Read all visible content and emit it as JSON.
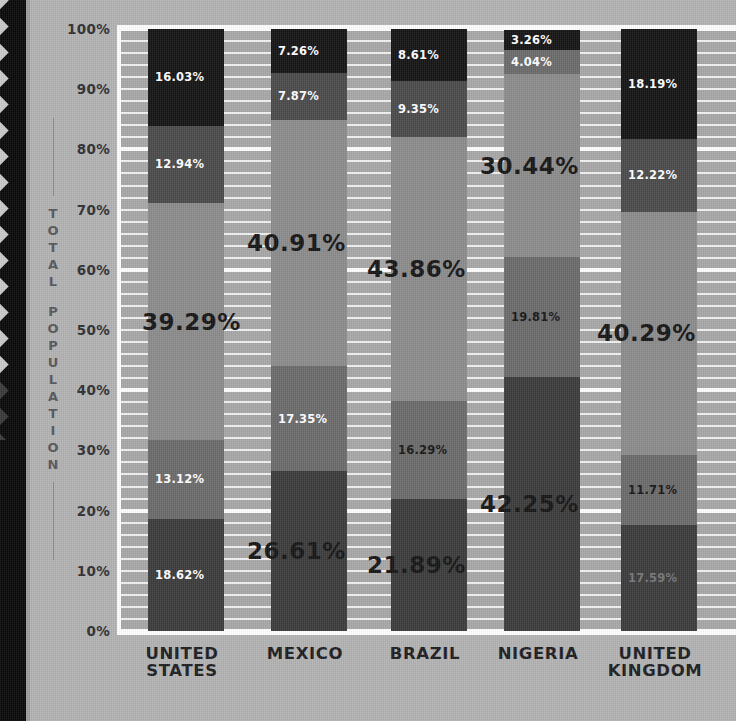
{
  "axis": {
    "title": "TOTAL POPULATION",
    "yticks": [
      "100%",
      "90%",
      "80%",
      "70%",
      "60%",
      "50%",
      "40%",
      "30%",
      "20%",
      "10%",
      "0%"
    ]
  },
  "colors": {
    "background": "#b3b3b3",
    "plot_background": "#a8a8a8",
    "gridline": "#f2f2f2",
    "gridline_major": "#ffffff",
    "band": "#080808",
    "segment_1": "#3b3b3b",
    "segment_2": "#6b6b6b",
    "segment_3": "#8c8c8c",
    "segment_4": "#4a4a4a",
    "segment_5": "#141414",
    "label_light": "#ffffff",
    "label_dark": "#151515"
  },
  "chart_data": {
    "type": "bar",
    "title": "",
    "xlabel": "",
    "ylabel": "TOTAL POPULATION",
    "ylim": [
      0,
      100
    ],
    "stacked": true,
    "grid": true,
    "legend": "none",
    "categories": [
      "UNITED STATES",
      "MEXICO",
      "BRAZIL",
      "NIGERIA",
      "UNITED KINGDOM"
    ],
    "category_lines": [
      [
        "UNITED",
        "STATES"
      ],
      [
        "MEXICO",
        ""
      ],
      [
        "BRAZIL",
        ""
      ],
      [
        "NIGERIA",
        ""
      ],
      [
        "UNITED",
        "KINGDOM"
      ]
    ],
    "series": [
      {
        "name": "Segment 1",
        "values": [
          18.62,
          26.61,
          21.89,
          42.25,
          17.59
        ]
      },
      {
        "name": "Segment 2",
        "values": [
          13.12,
          17.35,
          16.29,
          19.81,
          11.71
        ]
      },
      {
        "name": "Segment 3",
        "values": [
          39.29,
          40.91,
          43.86,
          30.44,
          40.29
        ]
      },
      {
        "name": "Segment 4",
        "values": [
          12.94,
          7.87,
          9.35,
          4.04,
          12.22
        ]
      },
      {
        "name": "Segment 5",
        "values": [
          16.03,
          7.26,
          8.61,
          3.26,
          18.19
        ]
      }
    ],
    "bars": [
      {
        "category": "UNITED STATES",
        "segments": [
          {
            "value": 18.62,
            "label": "18.62%",
            "color": "#3b3b3b",
            "text_color": "#ffffff",
            "emphasis": "small"
          },
          {
            "value": 13.12,
            "label": "13.12%",
            "color": "#6b6b6b",
            "text_color": "#ffffff",
            "emphasis": "small"
          },
          {
            "value": 39.29,
            "label": "39.29%",
            "color": "#8c8c8c",
            "text_color": "#151515",
            "emphasis": "big"
          },
          {
            "value": 12.94,
            "label": "12.94%",
            "color": "#4a4a4a",
            "text_color": "#ffffff",
            "emphasis": "small"
          },
          {
            "value": 16.03,
            "label": "16.03%",
            "color": "#141414",
            "text_color": "#ffffff",
            "emphasis": "small"
          }
        ]
      },
      {
        "category": "MEXICO",
        "segments": [
          {
            "value": 26.61,
            "label": "26.61%",
            "color": "#3b3b3b",
            "text_color": "#151515",
            "emphasis": "big"
          },
          {
            "value": 17.35,
            "label": "17.35%",
            "color": "#6b6b6b",
            "text_color": "#ffffff",
            "emphasis": "small"
          },
          {
            "value": 40.91,
            "label": "40.91%",
            "color": "#8c8c8c",
            "text_color": "#151515",
            "emphasis": "big"
          },
          {
            "value": 7.87,
            "label": "7.87%",
            "color": "#4a4a4a",
            "text_color": "#ffffff",
            "emphasis": "small"
          },
          {
            "value": 7.26,
            "label": "7.26%",
            "color": "#141414",
            "text_color": "#ffffff",
            "emphasis": "small"
          }
        ]
      },
      {
        "category": "BRAZIL",
        "segments": [
          {
            "value": 21.89,
            "label": "21.89%",
            "color": "#3b3b3b",
            "text_color": "#151515",
            "emphasis": "big"
          },
          {
            "value": 16.29,
            "label": "16.29%",
            "color": "#6b6b6b",
            "text_color": "#151515",
            "emphasis": "small"
          },
          {
            "value": 43.86,
            "label": "43.86%",
            "color": "#8c8c8c",
            "text_color": "#151515",
            "emphasis": "big"
          },
          {
            "value": 9.35,
            "label": "9.35%",
            "color": "#4a4a4a",
            "text_color": "#ffffff",
            "emphasis": "small"
          },
          {
            "value": 8.61,
            "label": "8.61%",
            "color": "#141414",
            "text_color": "#ffffff",
            "emphasis": "small"
          }
        ]
      },
      {
        "category": "NIGERIA",
        "segments": [
          {
            "value": 42.25,
            "label": "42.25%",
            "color": "#3b3b3b",
            "text_color": "#151515",
            "emphasis": "big"
          },
          {
            "value": 19.81,
            "label": "19.81%",
            "color": "#6b6b6b",
            "text_color": "#151515",
            "emphasis": "small"
          },
          {
            "value": 30.44,
            "label": "30.44%",
            "color": "#8c8c8c",
            "text_color": "#151515",
            "emphasis": "big"
          },
          {
            "value": 4.04,
            "label": "4.04%",
            "color": "#6b6b6b",
            "text_color": "#ffffff",
            "emphasis": "small"
          },
          {
            "value": 3.26,
            "label": "3.26%",
            "color": "#141414",
            "text_color": "#ffffff",
            "emphasis": "small"
          }
        ]
      },
      {
        "category": "UNITED KINGDOM",
        "segments": [
          {
            "value": 17.59,
            "label": "17.59%",
            "color": "#3b3b3b",
            "text_color": "#767676",
            "emphasis": "small"
          },
          {
            "value": 11.71,
            "label": "11.71%",
            "color": "#6b6b6b",
            "text_color": "#151515",
            "emphasis": "small"
          },
          {
            "value": 40.29,
            "label": "40.29%",
            "color": "#8c8c8c",
            "text_color": "#151515",
            "emphasis": "big"
          },
          {
            "value": 12.22,
            "label": "12.22%",
            "color": "#4a4a4a",
            "text_color": "#ffffff",
            "emphasis": "small"
          },
          {
            "value": 18.19,
            "label": "18.19%",
            "color": "#141414",
            "text_color": "#ffffff",
            "emphasis": "small"
          }
        ]
      }
    ]
  }
}
